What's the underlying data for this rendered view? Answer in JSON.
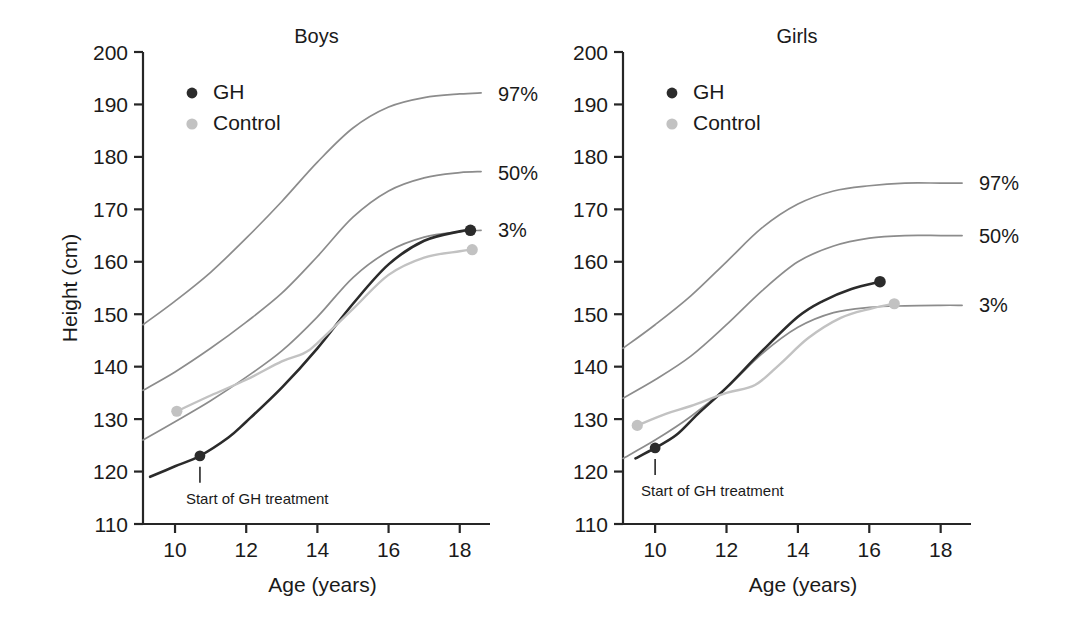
{
  "figure": {
    "background": "#ffffff",
    "colors": {
      "axis": "#262626",
      "text": "#1a1a1a",
      "gh": "#2b2b2b",
      "control": "#c2c2c2",
      "percentile": "#8c8c8c"
    }
  },
  "chart_data": [
    {
      "type": "line",
      "title": "Boys",
      "xlabel": "Age (years)",
      "ylabel": "Height (cm)",
      "xlim": [
        9.1,
        18.85
      ],
      "ylim": [
        110,
        200
      ],
      "xticks": [
        10,
        12,
        14,
        16,
        18
      ],
      "yticks": [
        110,
        120,
        130,
        140,
        150,
        160,
        170,
        180,
        190,
        200
      ],
      "grid": false,
      "legend_position": "top-left",
      "legend": [
        "GH",
        "Control"
      ],
      "annotations": [
        {
          "text": "Start of GH treatment",
          "x": 10.7,
          "y": 123
        }
      ],
      "curve_labels": [
        {
          "text": "97%",
          "x": 18.85,
          "y": 192
        },
        {
          "text": "50%",
          "x": 18.85,
          "y": 177
        },
        {
          "text": "3%",
          "x": 18.85,
          "y": 166
        }
      ],
      "series": [
        {
          "name": "97%",
          "kind": "percentile",
          "x": [
            9.1,
            10,
            11,
            12,
            13,
            14,
            15,
            16,
            17,
            18,
            18.6
          ],
          "values": [
            148,
            152.5,
            158,
            164.5,
            171.5,
            179,
            185.5,
            189.5,
            191.3,
            192,
            192.2
          ]
        },
        {
          "name": "50%",
          "kind": "percentile",
          "x": [
            9.1,
            10,
            11,
            12,
            13,
            14,
            15,
            16,
            17,
            18,
            18.6
          ],
          "values": [
            135.5,
            139,
            143.5,
            148.5,
            154,
            161,
            168.5,
            173.5,
            176,
            177,
            177.2
          ]
        },
        {
          "name": "3%",
          "kind": "percentile",
          "x": [
            9.1,
            10,
            11,
            12,
            13,
            14,
            15,
            16,
            17,
            18,
            18.6
          ],
          "values": [
            126,
            129.5,
            133.5,
            138,
            143,
            149.5,
            157,
            162,
            164.7,
            165.7,
            166
          ]
        },
        {
          "name": "GH",
          "kind": "patient",
          "x": [
            9.3,
            10,
            10.7,
            11.5,
            12,
            13,
            14,
            15,
            16,
            17,
            18,
            18.3
          ],
          "values": [
            119,
            121,
            123,
            126.5,
            129.5,
            136,
            143.5,
            152,
            159.5,
            164,
            165.8,
            166
          ],
          "start_marker": {
            "x": 10.7,
            "y": 123
          },
          "end_marker": {
            "x": 18.3,
            "y": 166
          }
        },
        {
          "name": "Control",
          "kind": "patient",
          "x": [
            10.05,
            11,
            12,
            13,
            13.6,
            14,
            15,
            16,
            17,
            18,
            18.35
          ],
          "values": [
            131.5,
            134.5,
            137.5,
            141,
            142.5,
            144.5,
            151,
            157.5,
            160.8,
            162,
            162.3
          ],
          "start_marker": {
            "x": 10.05,
            "y": 131.5
          },
          "end_marker": {
            "x": 18.35,
            "y": 162.3
          }
        }
      ]
    },
    {
      "type": "line",
      "title": "Girls",
      "xlabel": "Age (years)",
      "ylabel": "Height (cm)",
      "xlim": [
        9.1,
        18.85
      ],
      "ylim": [
        110,
        200
      ],
      "xticks": [
        10,
        12,
        14,
        16,
        18
      ],
      "yticks": [
        110,
        120,
        130,
        140,
        150,
        160,
        170,
        180,
        190,
        200
      ],
      "grid": false,
      "legend_position": "top-left",
      "legend": [
        "GH",
        "Control"
      ],
      "annotations": [
        {
          "text": "Start of GH treatment",
          "x": 10.0,
          "y": 124.5
        }
      ],
      "curve_labels": [
        {
          "text": "97%",
          "x": 18.85,
          "y": 175
        },
        {
          "text": "50%",
          "x": 18.85,
          "y": 165
        },
        {
          "text": "3%",
          "x": 18.85,
          "y": 151.7
        }
      ],
      "series": [
        {
          "name": "97%",
          "kind": "percentile",
          "x": [
            9.1,
            10,
            11,
            12,
            13,
            14,
            15,
            16,
            17,
            18,
            18.6
          ],
          "values": [
            143.5,
            148,
            153.5,
            160,
            166.5,
            171,
            173.5,
            174.5,
            175,
            175,
            175
          ]
        },
        {
          "name": "50%",
          "kind": "percentile",
          "x": [
            9.1,
            10,
            11,
            12,
            13,
            14,
            15,
            16,
            17,
            18,
            18.6
          ],
          "values": [
            134,
            137.5,
            142,
            148,
            154.5,
            160,
            163,
            164.5,
            165,
            165,
            165
          ]
        },
        {
          "name": "3%",
          "kind": "percentile",
          "x": [
            9.1,
            10,
            11,
            12,
            13,
            14,
            15,
            16,
            17,
            18,
            18.6
          ],
          "values": [
            122.5,
            126,
            130.5,
            136,
            142.5,
            147.5,
            150.3,
            151.3,
            151.6,
            151.7,
            151.7
          ]
        },
        {
          "name": "GH",
          "kind": "patient",
          "x": [
            9.45,
            10,
            10.6,
            11.2,
            12,
            13,
            14,
            14.7,
            15.5,
            16.3
          ],
          "values": [
            122.5,
            124.5,
            127,
            131,
            136,
            143,
            149.5,
            152.5,
            154.8,
            156.2
          ],
          "start_marker": {
            "x": 10.0,
            "y": 124.5
          },
          "end_marker": {
            "x": 16.3,
            "y": 156.2
          }
        },
        {
          "name": "Control",
          "kind": "patient",
          "x": [
            9.5,
            10.3,
            11,
            12,
            12.8,
            13.5,
            14.3,
            15.2,
            16,
            16.7
          ],
          "values": [
            128.8,
            131,
            132.5,
            135,
            136.5,
            140.5,
            145.5,
            149.3,
            151,
            152
          ],
          "start_marker": {
            "x": 9.5,
            "y": 128.8
          },
          "end_marker": {
            "x": 16.7,
            "y": 152
          }
        }
      ]
    }
  ]
}
